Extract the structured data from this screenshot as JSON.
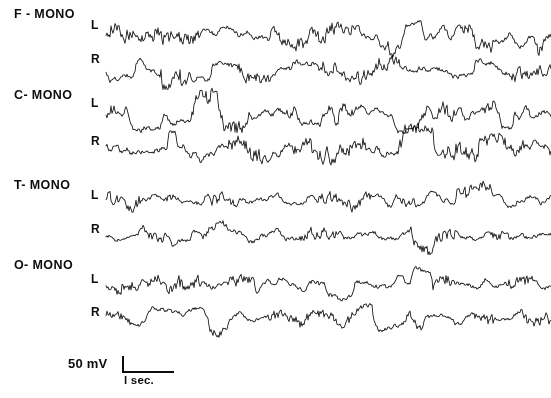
{
  "figure": {
    "background_color": "#ffffff",
    "trace_color": "#111111",
    "width": 551,
    "height": 398
  },
  "montages": [
    {
      "label": "F - MONO",
      "x": 14,
      "y": 7
    },
    {
      "label": "C- MONO",
      "x": 14,
      "y": 88
    },
    {
      "label": "T- MONO",
      "x": 14,
      "y": 178
    },
    {
      "label": "O- MONO",
      "x": 14,
      "y": 258
    }
  ],
  "side_labels": [
    {
      "label": "L",
      "x": 91,
      "y": 18
    },
    {
      "label": "R",
      "x": 91,
      "y": 52
    },
    {
      "label": "L",
      "x": 91,
      "y": 96
    },
    {
      "label": "R",
      "x": 91,
      "y": 134
    },
    {
      "label": "L",
      "x": 91,
      "y": 188
    },
    {
      "label": "R",
      "x": 91,
      "y": 222
    },
    {
      "label": "L",
      "x": 91,
      "y": 272
    },
    {
      "label": "R",
      "x": 91,
      "y": 305
    }
  ],
  "calibration": {
    "amplitude_label": "50 mV",
    "time_label": "l sec.",
    "amp_x": 68,
    "amp_y": 356,
    "vbar_x": 122,
    "vbar_y": 356,
    "vbar_height": 17,
    "hbar_x": 122,
    "hbar_y": 371,
    "hbar_width": 52,
    "time_x": 124,
    "time_y": 374
  },
  "chart_data": {
    "type": "line",
    "xlabel": "time",
    "ylabel": "amplitude",
    "legend_position": "left",
    "grid": false,
    "x_range": [
      0,
      551
    ],
    "plot_left": 106,
    "plot_right": 551,
    "time_calibration_seconds": 1,
    "amplitude_calibration_mv": 50,
    "series": [
      {
        "name": "F-MONO L",
        "montage": "F - MONO",
        "side": "L",
        "baseline_y": 36,
        "amplitude": 15,
        "seed": 1307,
        "squareness": 0.4,
        "burst_rate": 0.55,
        "spike_rate": 0.45,
        "values_note": "high-amplitude mixed-frequency activity with flat-topped plateaus"
      },
      {
        "name": "F-MONO R",
        "montage": "F - MONO",
        "side": "R",
        "baseline_y": 70,
        "amplitude": 14,
        "seed": 2711,
        "squareness": 0.45,
        "burst_rate": 0.6,
        "spike_rate": 0.5,
        "values_note": "rhythmic bursts with sharp negative deflections"
      },
      {
        "name": "C-MONO L",
        "montage": "C- MONO",
        "side": "L",
        "baseline_y": 112,
        "amplitude": 15,
        "seed": 4099,
        "squareness": 0.62,
        "burst_rate": 0.62,
        "spike_rate": 0.52,
        "values_note": "prominent square-topped plateaus alternating with spiky runs"
      },
      {
        "name": "C-MONO R",
        "montage": "C- MONO",
        "side": "R",
        "baseline_y": 150,
        "amplitude": 16,
        "seed": 5281,
        "squareness": 0.66,
        "burst_rate": 0.66,
        "spike_rate": 0.58,
        "values_note": "highest-amplitude channel, repeated clipped plateaus"
      },
      {
        "name": "T-MONO L",
        "montage": "T- MONO",
        "side": "L",
        "baseline_y": 200,
        "amplitude": 12,
        "seed": 6143,
        "squareness": 0.22,
        "burst_rate": 0.48,
        "spike_rate": 0.42,
        "values_note": "rounded medium-amplitude rhythmic waves"
      },
      {
        "name": "T-MONO R",
        "montage": "T- MONO",
        "side": "R",
        "baseline_y": 236,
        "amplitude": 12,
        "seed": 7717,
        "squareness": 0.26,
        "burst_rate": 0.52,
        "spike_rate": 0.46,
        "values_note": "rounded waves with intermittent fast spike clusters"
      },
      {
        "name": "O-MONO L",
        "montage": "O- MONO",
        "side": "L",
        "baseline_y": 284,
        "amplitude": 13,
        "seed": 8329,
        "squareness": 0.3,
        "burst_rate": 0.56,
        "spike_rate": 0.44,
        "values_note": "regular high-voltage rhythmic waves"
      },
      {
        "name": "O-MONO R",
        "montage": "O- MONO",
        "side": "R",
        "baseline_y": 318,
        "amplitude": 12,
        "seed": 9157,
        "squareness": 0.42,
        "burst_rate": 0.58,
        "spike_rate": 0.5,
        "values_note": "lower-voltage fast activity with sudden square bursts"
      }
    ]
  }
}
